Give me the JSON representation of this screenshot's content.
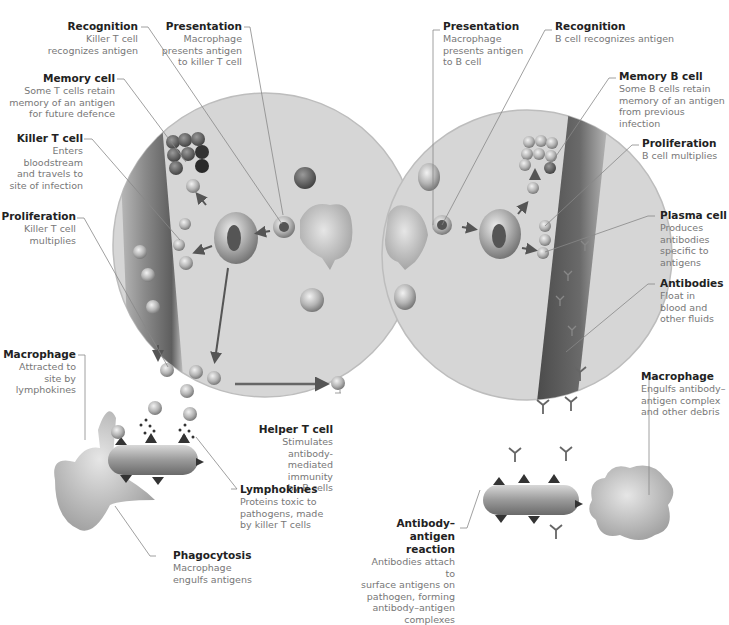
{
  "colors": {
    "background": "#ffffff",
    "circle_fill": "#d9d9d9",
    "vessel_dark": "#6b6b6b",
    "cell_fill": "#a9a9a9",
    "leader_line": "#888888",
    "title_text": "#222222",
    "body_text": "#777777"
  },
  "left_panel": {
    "name": "Cell-mediated immunity",
    "labels": {
      "recognition": {
        "title": "Recognition",
        "desc": "Killer T cell\nrecognizes antigen"
      },
      "presentation": {
        "title": "Presentation",
        "desc": "Macrophage\npresents antigen\nto killer T cell"
      },
      "memory_cell": {
        "title": "Memory cell",
        "desc": "Some T cells retain\nmemory of an antigen\nfor future defence"
      },
      "killer_t_cell": {
        "title": "Killer T cell",
        "desc": "Enters\nbloodstream\nand travels to\nsite of infection"
      },
      "proliferation": {
        "title": "Proliferation",
        "desc": "Killer T cell\nmultiplies"
      },
      "macrophage": {
        "title": "Macrophage",
        "desc": "Attracted to\nsite by\nlymphokines"
      },
      "helper_t_cell": {
        "title": "Helper T cell",
        "desc": "Stimulates antibody-\nmediated immunity\nby B cells"
      },
      "lymphokines": {
        "title": "Lymphokines",
        "desc": "Proteins toxic to\npathogens, made\nby killer T cells"
      },
      "phagocytosis": {
        "title": "Phagocytosis",
        "desc": "Macrophage\nengulfs antigens"
      }
    }
  },
  "right_panel": {
    "name": "Antibody-mediated immunity",
    "labels": {
      "presentation": {
        "title": "Presentation",
        "desc": "Macrophage\npresents antigen\nto B cell"
      },
      "recognition": {
        "title": "Recognition",
        "desc": "B cell recognizes antigen"
      },
      "memory_b_cell": {
        "title": "Memory B cell",
        "desc": "Some B cells retain\nmemory of an antigen\nfrom previous infection"
      },
      "proliferation": {
        "title": "Proliferation",
        "desc": "B cell multiplies"
      },
      "plasma_cell": {
        "title": "Plasma cell",
        "desc": "Produces\nantibodies\nspecific to\nantigens"
      },
      "antibodies": {
        "title": "Antibodies",
        "desc": "Float in\nblood and\nother fluids"
      },
      "macrophage": {
        "title": "Macrophage",
        "desc": "Engulfs antibody–\nantigen complex\nand other debris"
      },
      "antibody_antigen_reaction": {
        "title": "Antibody–antigen\nreaction",
        "desc": "Antibodies attach to\nsurface antigens on\npathogen, forming\nantibody–antigen\ncomplexes"
      }
    }
  }
}
